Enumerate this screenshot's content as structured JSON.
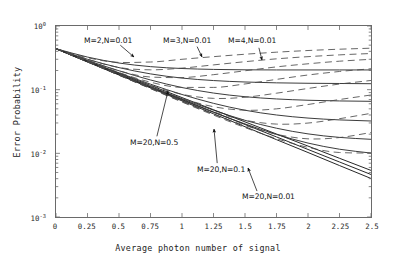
{
  "chart_data": {
    "type": "line",
    "title": "",
    "xlabel": "Average photon number of signal",
    "ylabel": "Error Probability",
    "xlim": [
      0,
      2.5
    ],
    "ylim": [
      0.001,
      1
    ],
    "yscale": "log",
    "xscale": "linear",
    "grid": false,
    "legend": "none",
    "xticks": [
      "0",
      "0.25",
      "0.5",
      "0.75",
      "1",
      "1.25",
      "1.5",
      "1.75",
      "2",
      "2.25",
      "2.5"
    ],
    "xtick_values": [
      0,
      0.25,
      0.5,
      0.75,
      1,
      1.25,
      1.5,
      1.75,
      2,
      2.25,
      2.5
    ],
    "ytick_labels": [
      "10",
      "10",
      "10",
      "10"
    ],
    "ytick_exponents": [
      "0",
      "-1",
      "-2",
      "-3"
    ],
    "ytick_values": [
      1,
      0.1,
      0.01,
      0.001
    ],
    "annotations": [
      {
        "id": "a1",
        "text": "M=2,N=0.01",
        "label_x": 84,
        "label_y": 36,
        "tip_x": 133,
        "tip_y": 56
      },
      {
        "id": "a2",
        "text": "M=3,N=0.01",
        "label_x": 163,
        "label_y": 36,
        "tip_x": 201,
        "tip_y": 56
      },
      {
        "id": "a3",
        "text": "M=4,N=0.01",
        "label_x": 228,
        "label_y": 36,
        "tip_x": 261,
        "tip_y": 59
      },
      {
        "id": "a4",
        "text": "M=20,N=0.5",
        "label_x": 130,
        "label_y": 138,
        "tip_x": 167,
        "tip_y": 90
      },
      {
        "id": "a5",
        "text": "M=20,N=0.1",
        "label_x": 197,
        "label_y": 165,
        "tip_x": 213,
        "tip_y": 128
      },
      {
        "id": "a6",
        "text": "M=20,N=0.01",
        "label_x": 242,
        "label_y": 192,
        "tip_x": 247,
        "tip_y": 167
      }
    ],
    "series": [
      {
        "name": "M=20,N=0.01",
        "style": "solid",
        "color": "#1a1a1a",
        "x": [
          0,
          0.125,
          0.25,
          0.375,
          0.5,
          0.75,
          1,
          1.25,
          1.5,
          1.75,
          2,
          2.25,
          2.5
        ],
        "y": [
          0.44,
          0.345,
          0.272,
          0.215,
          0.17,
          0.1065,
          0.0667,
          0.0418,
          0.0262,
          0.0164,
          0.0103,
          0.00643,
          0.00403
        ]
      },
      {
        "name": "M=20,N=0.1",
        "style": "solid",
        "color": "#1a1a1a",
        "x": [
          0,
          0.125,
          0.25,
          0.375,
          0.5,
          0.75,
          1,
          1.25,
          1.5,
          1.75,
          2,
          2.25,
          2.5
        ],
        "y": [
          0.44,
          0.348,
          0.276,
          0.219,
          0.174,
          0.1105,
          0.0702,
          0.0446,
          0.0284,
          0.0181,
          0.0115,
          0.00731,
          0.00465
        ]
      },
      {
        "name": "M=20,N=0.5",
        "style": "solid",
        "color": "#1a1a1a",
        "x": [
          0,
          0.125,
          0.25,
          0.375,
          0.5,
          0.75,
          1,
          1.25,
          1.5,
          1.75,
          2,
          2.25,
          2.5
        ],
        "y": [
          0.44,
          0.352,
          0.282,
          0.226,
          0.181,
          0.1165,
          0.0751,
          0.0484,
          0.0312,
          0.0201,
          0.013,
          0.00836,
          0.00539
        ]
      },
      {
        "name": "solid-rise-1",
        "style": "solid",
        "color": "#303030",
        "x": [
          0,
          0.25,
          0.5,
          0.75,
          1,
          1.25,
          1.5,
          1.75,
          2,
          2.25,
          2.5
        ],
        "y": [
          0.44,
          0.325,
          0.262,
          0.23,
          0.215,
          0.208,
          0.205,
          0.204,
          0.204,
          0.204,
          0.204
        ]
      },
      {
        "name": "solid-rise-2",
        "style": "solid",
        "color": "#303030",
        "x": [
          0,
          0.25,
          0.5,
          0.75,
          1,
          1.25,
          1.5,
          1.75,
          2,
          2.25,
          2.5
        ],
        "y": [
          0.44,
          0.3,
          0.222,
          0.177,
          0.152,
          0.139,
          0.132,
          0.128,
          0.126,
          0.125,
          0.124
        ]
      },
      {
        "name": "solid-rise-3",
        "style": "solid",
        "color": "#303030",
        "x": [
          0,
          0.25,
          0.5,
          0.75,
          1,
          1.25,
          1.5,
          1.75,
          2,
          2.25,
          2.5
        ],
        "y": [
          0.44,
          0.288,
          0.198,
          0.142,
          0.108,
          0.0885,
          0.0775,
          0.0715,
          0.0682,
          0.0665,
          0.0656
        ]
      },
      {
        "name": "solid-rise-4",
        "style": "solid",
        "color": "#303030",
        "x": [
          0,
          0.25,
          0.5,
          0.75,
          1,
          1.25,
          1.5,
          1.75,
          2,
          2.25,
          2.5
        ],
        "y": [
          0.44,
          0.28,
          0.184,
          0.122,
          0.084,
          0.061,
          0.0475,
          0.04,
          0.0358,
          0.0335,
          0.0322
        ]
      },
      {
        "name": "solid-rise-5",
        "style": "solid",
        "color": "#303030",
        "x": [
          0,
          0.25,
          0.5,
          0.75,
          1,
          1.25,
          1.5,
          1.75,
          2,
          2.25,
          2.5
        ],
        "y": [
          0.44,
          0.276,
          0.176,
          0.112,
          0.072,
          0.0476,
          0.033,
          0.0248,
          0.0202,
          0.0178,
          0.0166
        ]
      },
      {
        "name": "solid-rise-6",
        "style": "solid",
        "color": "#303030",
        "x": [
          0,
          0.25,
          0.5,
          0.75,
          1,
          1.25,
          1.5,
          1.75,
          2,
          2.25,
          2.5
        ],
        "y": [
          0.44,
          0.274,
          0.172,
          0.1085,
          0.0688,
          0.0441,
          0.029,
          0.0198,
          0.0145,
          0.0116,
          0.0101
        ]
      },
      {
        "name": "M=2,N=0.01 family",
        "style": "dashed",
        "color": "#4a4a4a",
        "x": [
          0,
          0.25,
          0.5,
          0.75,
          1,
          1.25,
          1.5,
          1.75,
          2,
          2.25,
          2.5
        ],
        "y": [
          0.44,
          0.318,
          0.268,
          0.272,
          0.3,
          0.33,
          0.36,
          0.388,
          0.412,
          0.432,
          0.448
        ]
      },
      {
        "name": "dash-2",
        "style": "dashed",
        "color": "#4a4a4a",
        "x": [
          0,
          0.25,
          0.5,
          0.75,
          1,
          1.25,
          1.5,
          1.75,
          2,
          2.25,
          2.5
        ],
        "y": [
          0.44,
          0.3,
          0.223,
          0.205,
          0.218,
          0.245,
          0.275,
          0.305,
          0.33,
          0.352,
          0.37
        ]
      },
      {
        "name": "M=3,N=0.01 family",
        "style": "dashed",
        "color": "#4a4a4a",
        "x": [
          0,
          0.25,
          0.5,
          0.75,
          1,
          1.25,
          1.5,
          1.75,
          2,
          2.25,
          2.5
        ],
        "y": [
          0.44,
          0.29,
          0.198,
          0.158,
          0.155,
          0.172,
          0.198,
          0.228,
          0.255,
          0.28,
          0.3
        ]
      },
      {
        "name": "dash-4",
        "style": "dashed",
        "color": "#4a4a4a",
        "x": [
          0,
          0.25,
          0.5,
          0.75,
          1,
          1.25,
          1.5,
          1.75,
          2,
          2.25,
          2.5
        ],
        "y": [
          0.44,
          0.284,
          0.186,
          0.131,
          0.1085,
          0.1085,
          0.123,
          0.145,
          0.17,
          0.193,
          0.213
        ]
      },
      {
        "name": "M=4,N=0.01 family",
        "style": "dashed",
        "color": "#4a4a4a",
        "x": [
          0,
          0.25,
          0.5,
          0.75,
          1,
          1.25,
          1.5,
          1.75,
          2,
          2.25,
          2.5
        ],
        "y": [
          0.44,
          0.28,
          0.178,
          0.1175,
          0.0845,
          0.073,
          0.076,
          0.088,
          0.1045,
          0.1225,
          0.1395
        ]
      },
      {
        "name": "dash-6",
        "style": "dashed",
        "color": "#4a4a4a",
        "x": [
          0,
          0.25,
          0.5,
          0.75,
          1,
          1.25,
          1.5,
          1.75,
          2,
          2.25,
          2.5
        ],
        "y": [
          0.44,
          0.277,
          0.173,
          0.11,
          0.073,
          0.054,
          0.0475,
          0.05,
          0.0585,
          0.07,
          0.0825
        ]
      },
      {
        "name": "dash-7",
        "style": "dashed",
        "color": "#4a4a4a",
        "x": [
          0,
          0.25,
          0.5,
          0.75,
          1,
          1.25,
          1.5,
          1.75,
          2,
          2.25,
          2.5
        ],
        "y": [
          0.44,
          0.275,
          0.17,
          0.106,
          0.0672,
          0.0448,
          0.0331,
          0.0288,
          0.0299,
          0.035,
          0.0425
        ]
      },
      {
        "name": "dash-8",
        "style": "dashed",
        "color": "#4a4a4a",
        "x": [
          0,
          0.25,
          0.5,
          0.75,
          1,
          1.25,
          1.5,
          1.75,
          2,
          2.25,
          2.5
        ],
        "y": [
          0.44,
          0.274,
          0.169,
          0.1045,
          0.065,
          0.0412,
          0.0274,
          0.0199,
          0.0169,
          0.0177,
          0.0212
        ]
      },
      {
        "name": "dash-9",
        "style": "dashed",
        "color": "#4a4a4a",
        "x": [
          0,
          0.25,
          0.5,
          0.75,
          1,
          1.25,
          1.5,
          1.75,
          2,
          2.25,
          2.5
        ],
        "y": [
          0.44,
          0.273,
          0.1685,
          0.1038,
          0.064,
          0.0399,
          0.0254,
          0.017,
          0.0124,
          0.0103,
          0.0101
        ]
      }
    ]
  }
}
